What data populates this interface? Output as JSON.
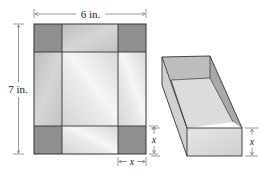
{
  "diagram": {
    "flat_sheet": {
      "width_label": "6 in.",
      "height_label": "7 in.",
      "cut_size_label_horizontal": "x",
      "cut_size_label_vertical": "x"
    },
    "box": {
      "height_label": "x"
    },
    "colors": {
      "corner_square": "#8f8f8f",
      "side_flap": "#c9c9c9",
      "base": "#e2e2e2",
      "outline": "#333333"
    }
  }
}
